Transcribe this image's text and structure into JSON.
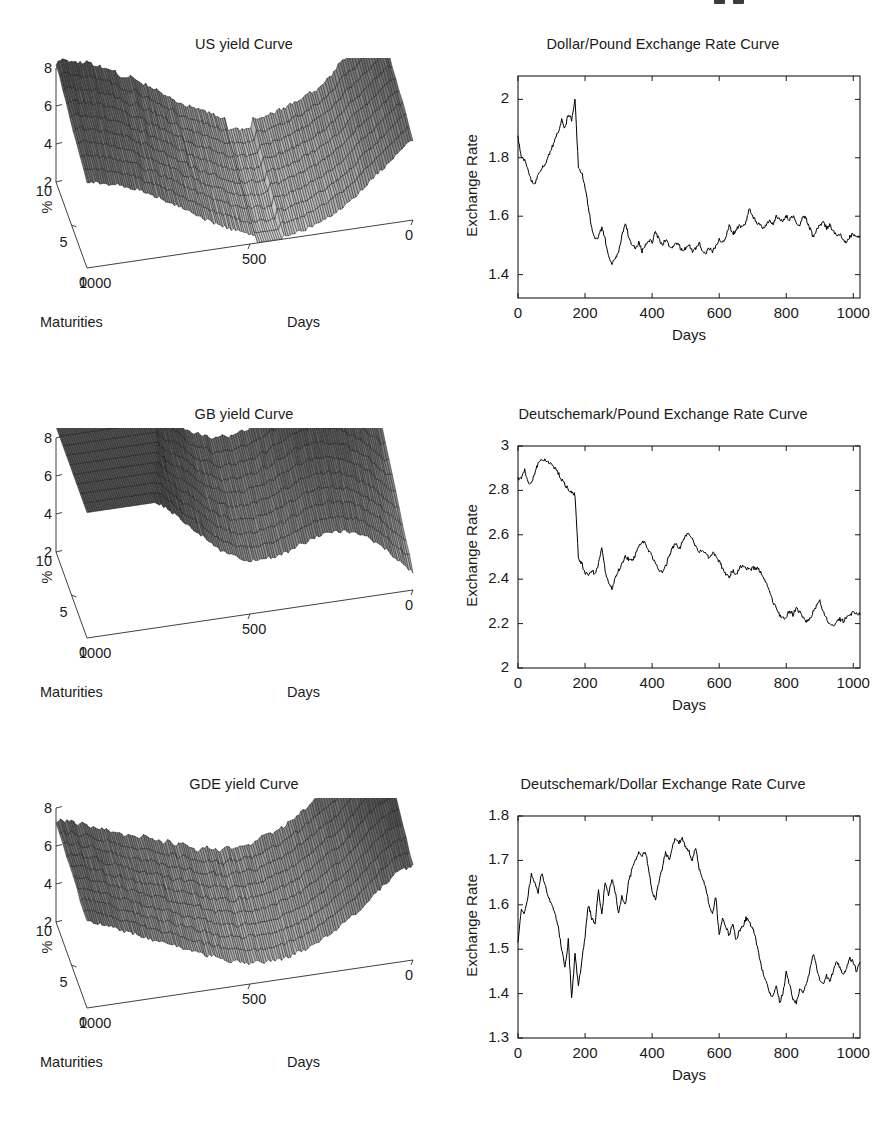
{
  "figure": {
    "width": 885,
    "height": 1121,
    "background": "#ffffff",
    "ink": "#1a1a1a",
    "line_color": "#000000"
  },
  "panels": [
    {
      "id": "us-yield-curve",
      "kind": "surface3d",
      "title": "US yield Curve",
      "zlabel": "%",
      "xlabel": "Maturities",
      "ylabel": "Days",
      "zticks": [
        "8",
        "6",
        "4",
        "2"
      ],
      "ztick_values": [
        8,
        6,
        4,
        2
      ],
      "xticks": [
        "10",
        "5",
        "0"
      ],
      "xtick_values": [
        10,
        5,
        0
      ],
      "yticks": [
        "1000",
        "500",
        "0"
      ],
      "ytick_values": [
        1000,
        500,
        0
      ]
    },
    {
      "id": "gb-yield-curve",
      "kind": "surface3d",
      "title": "GB yield Curve",
      "zlabel": "%",
      "xlabel": "Maturities",
      "ylabel": "Days",
      "zticks": [
        "8",
        "6",
        "4",
        "2"
      ],
      "ztick_values": [
        8,
        6,
        4,
        2
      ],
      "xticks": [
        "10",
        "5",
        "0"
      ],
      "xtick_values": [
        10,
        5,
        0
      ],
      "yticks": [
        "1000",
        "500",
        "0"
      ],
      "ytick_values": [
        1000,
        500,
        0
      ]
    },
    {
      "id": "gde-yield-curve",
      "kind": "surface3d",
      "title": "GDE yield Curve",
      "zlabel": "%",
      "xlabel": "Maturities",
      "ylabel": "Days",
      "zticks": [
        "8",
        "6",
        "4",
        "2"
      ],
      "ztick_values": [
        8,
        6,
        4,
        2
      ],
      "xticks": [
        "10",
        "5",
        "0"
      ],
      "xtick_values": [
        10,
        5,
        0
      ],
      "yticks": [
        "1000",
        "500",
        "0"
      ],
      "ytick_values": [
        1000,
        500,
        0
      ]
    }
  ],
  "chart_data": [
    {
      "id": "us-yield-curve",
      "type": "surface",
      "title": "US yield Curve",
      "xlabel": "Maturities",
      "ylabel": "Days",
      "zlabel": "%",
      "xlim": [
        0,
        10
      ],
      "ylim": [
        0,
        1000
      ],
      "zlim": [
        2,
        8
      ],
      "xticks": [
        0,
        5,
        10
      ],
      "yticks": [
        0,
        500,
        1000
      ],
      "zticks": [
        2,
        4,
        6,
        8
      ],
      "grid": false,
      "legend": "none",
      "description": "Mesh surface of US zero-coupon yields (%) across 10 maturities over ~1020 trading days. Short end starts near 6% then the whole curve rises to a hump above 8% around days 300-500, dips to a trough near 2-3% in the middle, then rebuilds a second high plateau near 8% toward day 0 of the reversed Days axis.",
      "maturities": [
        1,
        2,
        3,
        4,
        5,
        6,
        7,
        8,
        9,
        10
      ],
      "day_samples": [
        0,
        100,
        200,
        300,
        400,
        500,
        600,
        700,
        800,
        900,
        1000
      ],
      "z_profile_short_maturity": [
        6.2,
        5.9,
        5.4,
        4.6,
        3.8,
        3.2,
        3.0,
        3.2,
        4.1,
        5.2,
        5.6
      ],
      "z_profile_long_maturity": [
        6.6,
        7.1,
        7.6,
        8.0,
        8.2,
        7.7,
        6.9,
        6.6,
        7.2,
        7.9,
        8.1
      ]
    },
    {
      "id": "dollar-pound",
      "type": "line",
      "title": "Dollar/Pound Exchange Rate Curve",
      "xlabel": "Days",
      "ylabel": "Exchange Rate",
      "xlim": [
        0,
        1020
      ],
      "ylim": [
        1.32,
        2.08
      ],
      "xticks": [
        0,
        200,
        400,
        600,
        800,
        1000
      ],
      "yticks": [
        1.4,
        1.6,
        1.8,
        2.0
      ],
      "ytick_labels": [
        "1.4",
        "1.6",
        "1.8",
        "2"
      ],
      "grid": false,
      "legend": "none",
      "x": [
        0,
        10,
        20,
        30,
        40,
        50,
        60,
        70,
        80,
        90,
        100,
        110,
        120,
        130,
        140,
        150,
        160,
        170,
        180,
        190,
        200,
        210,
        220,
        230,
        240,
        250,
        260,
        270,
        280,
        290,
        300,
        310,
        320,
        330,
        340,
        350,
        360,
        370,
        380,
        390,
        400,
        410,
        420,
        430,
        440,
        450,
        460,
        470,
        480,
        490,
        500,
        510,
        520,
        530,
        540,
        550,
        560,
        570,
        580,
        590,
        600,
        610,
        620,
        630,
        640,
        650,
        660,
        670,
        680,
        690,
        700,
        710,
        720,
        730,
        740,
        750,
        760,
        770,
        780,
        790,
        800,
        810,
        820,
        830,
        840,
        850,
        860,
        870,
        880,
        890,
        900,
        910,
        920,
        930,
        940,
        950,
        960,
        970,
        980,
        990,
        1000,
        1010,
        1020
      ],
      "y": [
        1.87,
        1.8,
        1.79,
        1.76,
        1.72,
        1.71,
        1.74,
        1.76,
        1.78,
        1.8,
        1.83,
        1.86,
        1.89,
        1.93,
        1.9,
        1.95,
        1.93,
        2.0,
        1.77,
        1.75,
        1.7,
        1.63,
        1.56,
        1.52,
        1.53,
        1.56,
        1.52,
        1.46,
        1.44,
        1.45,
        1.48,
        1.53,
        1.58,
        1.53,
        1.5,
        1.49,
        1.51,
        1.48,
        1.5,
        1.52,
        1.51,
        1.55,
        1.52,
        1.5,
        1.52,
        1.5,
        1.49,
        1.51,
        1.5,
        1.48,
        1.49,
        1.5,
        1.48,
        1.49,
        1.51,
        1.48,
        1.47,
        1.49,
        1.48,
        1.5,
        1.52,
        1.51,
        1.53,
        1.57,
        1.54,
        1.55,
        1.57,
        1.56,
        1.58,
        1.63,
        1.6,
        1.58,
        1.57,
        1.56,
        1.57,
        1.59,
        1.57,
        1.6,
        1.59,
        1.58,
        1.6,
        1.59,
        1.6,
        1.58,
        1.57,
        1.6,
        1.59,
        1.56,
        1.53,
        1.55,
        1.57,
        1.58,
        1.56,
        1.57,
        1.55,
        1.53,
        1.54,
        1.52,
        1.51,
        1.53,
        1.54,
        1.53,
        1.53
      ]
    },
    {
      "id": "gb-yield-curve",
      "type": "surface",
      "title": "GB yield Curve",
      "xlabel": "Maturities",
      "ylabel": "Days",
      "zlabel": "%",
      "xlim": [
        0,
        10
      ],
      "ylim": [
        0,
        1000
      ],
      "zlim": [
        2,
        8
      ],
      "xticks": [
        0,
        5,
        10
      ],
      "yticks": [
        0,
        500,
        1000
      ],
      "zticks": [
        2,
        4,
        6,
        8
      ],
      "grid": false,
      "legend": "none",
      "description": "Mesh surface of UK (Great Britain) zero-coupon yields (%). The short-maturity edge starts near 8% and slopes steadily down to roughly 2-3%, while the long-maturity edge stays elevated, giving a broad twisted sheet with a raised shelf toward low Days.",
      "maturities": [
        1,
        2,
        3,
        4,
        5,
        6,
        7,
        8,
        9,
        10
      ],
      "day_samples": [
        0,
        100,
        200,
        300,
        400,
        500,
        600,
        700,
        800,
        900,
        1000
      ],
      "z_profile_short_maturity": [
        8.1,
        7.6,
        6.9,
        6.1,
        5.2,
        4.3,
        3.6,
        3.1,
        2.8,
        2.6,
        2.4
      ],
      "z_profile_long_maturity": [
        8.3,
        8.1,
        7.8,
        7.6,
        7.4,
        7.3,
        7.5,
        7.8,
        8.0,
        8.1,
        8.0
      ]
    },
    {
      "id": "deutschemark-pound",
      "type": "line",
      "title": "Deutschemark/Pound Exchange Rate Curve",
      "xlabel": "Days",
      "ylabel": "Exchange Rate",
      "xlim": [
        0,
        1020
      ],
      "ylim": [
        2.0,
        3.0
      ],
      "xticks": [
        0,
        200,
        400,
        600,
        800,
        1000
      ],
      "yticks": [
        2.0,
        2.2,
        2.4,
        2.6,
        2.8,
        3.0
      ],
      "ytick_labels": [
        "2",
        "2.2",
        "2.4",
        "2.6",
        "2.8",
        "3"
      ],
      "grid": false,
      "legend": "none",
      "x": [
        0,
        10,
        20,
        30,
        40,
        50,
        60,
        70,
        80,
        90,
        100,
        110,
        120,
        130,
        140,
        150,
        160,
        170,
        180,
        190,
        200,
        210,
        220,
        230,
        240,
        250,
        260,
        270,
        280,
        290,
        300,
        310,
        320,
        330,
        340,
        350,
        360,
        370,
        380,
        390,
        400,
        410,
        420,
        430,
        440,
        450,
        460,
        470,
        480,
        490,
        500,
        510,
        520,
        530,
        540,
        550,
        560,
        570,
        580,
        590,
        600,
        610,
        620,
        630,
        640,
        650,
        660,
        670,
        680,
        690,
        700,
        710,
        720,
        730,
        740,
        750,
        760,
        770,
        780,
        790,
        800,
        810,
        820,
        830,
        840,
        850,
        860,
        870,
        880,
        890,
        900,
        910,
        920,
        930,
        940,
        950,
        960,
        970,
        980,
        990,
        1000,
        1010,
        1020
      ],
      "y": [
        2.85,
        2.86,
        2.89,
        2.84,
        2.83,
        2.88,
        2.92,
        2.94,
        2.94,
        2.93,
        2.92,
        2.9,
        2.88,
        2.85,
        2.83,
        2.8,
        2.79,
        2.78,
        2.5,
        2.47,
        2.43,
        2.42,
        2.44,
        2.42,
        2.47,
        2.54,
        2.44,
        2.38,
        2.36,
        2.4,
        2.44,
        2.47,
        2.5,
        2.49,
        2.48,
        2.51,
        2.55,
        2.57,
        2.56,
        2.53,
        2.5,
        2.47,
        2.44,
        2.43,
        2.46,
        2.5,
        2.54,
        2.56,
        2.53,
        2.57,
        2.6,
        2.61,
        2.58,
        2.55,
        2.52,
        2.53,
        2.51,
        2.5,
        2.52,
        2.5,
        2.48,
        2.45,
        2.42,
        2.41,
        2.44,
        2.42,
        2.45,
        2.46,
        2.45,
        2.44,
        2.45,
        2.45,
        2.44,
        2.42,
        2.38,
        2.34,
        2.3,
        2.27,
        2.24,
        2.22,
        2.23,
        2.26,
        2.24,
        2.27,
        2.25,
        2.23,
        2.21,
        2.22,
        2.25,
        2.28,
        2.3,
        2.26,
        2.22,
        2.2,
        2.19,
        2.21,
        2.22,
        2.21,
        2.23,
        2.24,
        2.25,
        2.25,
        2.24
      ]
    },
    {
      "id": "gde-yield-curve",
      "type": "surface",
      "title": "GDE yield Curve",
      "xlabel": "Maturities",
      "ylabel": "Days",
      "zlabel": "%",
      "xlim": [
        0,
        10
      ],
      "ylim": [
        0,
        1000
      ],
      "zlim": [
        2,
        8
      ],
      "xticks": [
        0,
        5,
        10
      ],
      "yticks": [
        0,
        500,
        1000
      ],
      "zticks": [
        2,
        4,
        6,
        8
      ],
      "grid": false,
      "legend": "none",
      "description": "Mesh surface of German zero-coupon yields (%). The sheet starts around 6.5% at the near corner, sags into a wide valley near 3% in the middle of the Days axis, then lifts again to a smooth plateau near 7-8% at the far end.",
      "maturities": [
        1,
        2,
        3,
        4,
        5,
        6,
        7,
        8,
        9,
        10
      ],
      "day_samples": [
        0,
        100,
        200,
        300,
        400,
        500,
        600,
        700,
        800,
        900,
        1000
      ],
      "z_profile_short_maturity": [
        6.6,
        6.2,
        5.5,
        4.6,
        3.8,
        3.2,
        3.0,
        3.3,
        4.0,
        4.6,
        5.0
      ],
      "z_profile_long_maturity": [
        6.8,
        7.0,
        7.3,
        7.5,
        7.4,
        7.1,
        7.0,
        7.3,
        7.7,
        8.0,
        8.0
      ]
    },
    {
      "id": "deutschemark-dollar",
      "type": "line",
      "title": "Deutschemark/Dollar Exchange Rate Curve",
      "xlabel": "Days",
      "ylabel": "Exchange Rate",
      "xlim": [
        0,
        1020
      ],
      "ylim": [
        1.3,
        1.8
      ],
      "xticks": [
        0,
        200,
        400,
        600,
        800,
        1000
      ],
      "yticks": [
        1.3,
        1.4,
        1.5,
        1.6,
        1.7,
        1.8
      ],
      "ytick_labels": [
        "1.3",
        "1.4",
        "1.5",
        "1.6",
        "1.7",
        "1.8"
      ],
      "grid": false,
      "legend": "none",
      "x": [
        0,
        10,
        20,
        30,
        40,
        50,
        60,
        70,
        80,
        90,
        100,
        110,
        120,
        130,
        140,
        150,
        160,
        170,
        180,
        190,
        200,
        210,
        220,
        230,
        240,
        250,
        260,
        270,
        280,
        290,
        300,
        310,
        320,
        330,
        340,
        350,
        360,
        370,
        380,
        390,
        400,
        410,
        420,
        430,
        440,
        450,
        460,
        470,
        480,
        490,
        500,
        510,
        520,
        530,
        540,
        550,
        560,
        570,
        580,
        590,
        600,
        610,
        620,
        630,
        640,
        650,
        660,
        670,
        680,
        690,
        700,
        710,
        720,
        730,
        740,
        750,
        760,
        770,
        780,
        790,
        800,
        810,
        820,
        830,
        840,
        850,
        860,
        870,
        880,
        890,
        900,
        910,
        920,
        930,
        940,
        950,
        960,
        970,
        980,
        990,
        1000,
        1010,
        1020
      ],
      "y": [
        1.52,
        1.59,
        1.58,
        1.62,
        1.67,
        1.65,
        1.63,
        1.67,
        1.65,
        1.62,
        1.6,
        1.58,
        1.55,
        1.5,
        1.46,
        1.52,
        1.39,
        1.49,
        1.42,
        1.47,
        1.53,
        1.6,
        1.57,
        1.56,
        1.63,
        1.58,
        1.65,
        1.62,
        1.66,
        1.63,
        1.58,
        1.62,
        1.6,
        1.65,
        1.68,
        1.7,
        1.72,
        1.71,
        1.72,
        1.68,
        1.63,
        1.61,
        1.65,
        1.68,
        1.72,
        1.7,
        1.73,
        1.75,
        1.74,
        1.75,
        1.73,
        1.72,
        1.7,
        1.73,
        1.68,
        1.66,
        1.64,
        1.6,
        1.58,
        1.62,
        1.53,
        1.57,
        1.55,
        1.53,
        1.56,
        1.52,
        1.54,
        1.55,
        1.57,
        1.56,
        1.55,
        1.52,
        1.48,
        1.45,
        1.43,
        1.4,
        1.39,
        1.42,
        1.38,
        1.4,
        1.45,
        1.42,
        1.39,
        1.38,
        1.41,
        1.4,
        1.42,
        1.45,
        1.49,
        1.46,
        1.43,
        1.42,
        1.44,
        1.43,
        1.45,
        1.47,
        1.46,
        1.44,
        1.46,
        1.48,
        1.47,
        1.45,
        1.47
      ]
    }
  ]
}
